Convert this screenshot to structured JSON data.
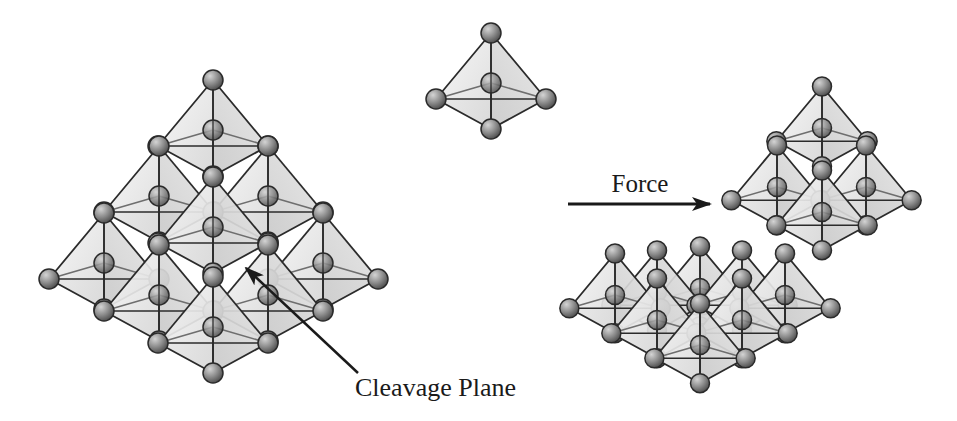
{
  "figure": {
    "width": 957,
    "height": 421,
    "background": "#ffffff",
    "colors": {
      "edge": "#2b2b2b",
      "inner_edge": "#6e6e6e",
      "face_light": "#efefef",
      "face_mid": "#dcdcdc",
      "face_dark": "#bdbdbd",
      "atom_fill_light": "#b5b5b5",
      "atom_fill_dark": "#5a5a5a",
      "atom_stroke": "#2a2a2a",
      "text": "#1a1a1a"
    }
  },
  "labels": {
    "force": "Force",
    "cleavage_plane": "Cleavage Plane"
  },
  "tetrahedron_unit": {
    "apex": [
      0,
      -50
    ],
    "left": [
      -55,
      16
    ],
    "right": [
      55,
      16
    ],
    "bottom": [
      0,
      46
    ],
    "atom_radius": 10
  },
  "groups": [
    {
      "name": "single-tetrahedron",
      "scale": 1.0,
      "centers": [
        [
          491,
          83
        ]
      ]
    },
    {
      "name": "intact-crystal",
      "scale": 1.0,
      "centers": [
        [
          213,
          130
        ],
        [
          159,
          196
        ],
        [
          268,
          196
        ],
        [
          104,
          263
        ],
        [
          213,
          227
        ],
        [
          323,
          263
        ],
        [
          159,
          295
        ],
        [
          268,
          295
        ],
        [
          213,
          327
        ]
      ]
    },
    {
      "name": "cleaved-upper-fragment",
      "scale": 0.83,
      "centers": [
        [
          822,
          128
        ],
        [
          777,
          187
        ],
        [
          866,
          187
        ],
        [
          822,
          212
        ]
      ]
    },
    {
      "name": "cleaved-lower-fragment",
      "scale": 0.83,
      "centers": [
        [
          615,
          295
        ],
        [
          657,
          292
        ],
        [
          657,
          320
        ],
        [
          742,
          292
        ],
        [
          785,
          295
        ],
        [
          700,
          288
        ],
        [
          742,
          320
        ],
        [
          700,
          345
        ]
      ]
    }
  ],
  "force_arrow": {
    "x1": 568,
    "y1": 204,
    "x2": 710,
    "y2": 204,
    "label_pos": [
      640,
      192
    ]
  },
  "cleavage_arrow": {
    "x1": 358,
    "y1": 373,
    "x2": 246,
    "y2": 268,
    "label_pos": [
      355,
      396
    ]
  }
}
